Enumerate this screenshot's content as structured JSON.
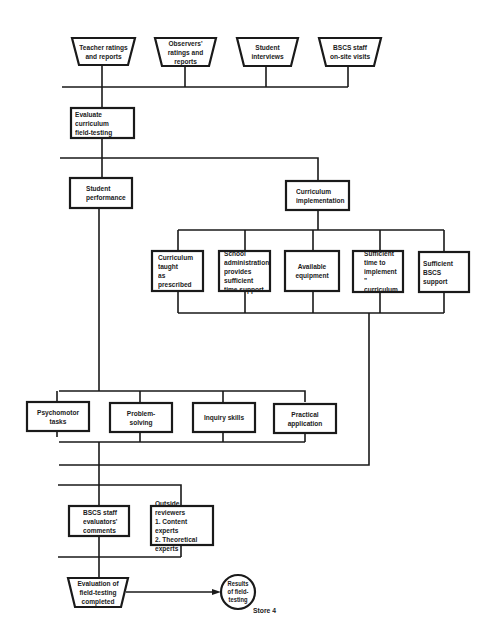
{
  "diagram": {
    "type": "flowchart",
    "inputs": [
      {
        "id": "teacher",
        "label": "Teacher ratings\nand reports",
        "shape": "trapezoid"
      },
      {
        "id": "observers",
        "label": "Observers'\nratings and\nreports",
        "shape": "trapezoid"
      },
      {
        "id": "students",
        "label": "Student\ninterviews",
        "shape": "trapezoid"
      },
      {
        "id": "bscs_visits",
        "label": "BSCS staff\non-site visits",
        "shape": "trapezoid"
      }
    ],
    "evaluate": {
      "label": "Evaluate curriculum\nfield-testing",
      "shape": "process"
    },
    "student_performance": {
      "label": "Student\nperformance",
      "shape": "process"
    },
    "curriculum_implementation": {
      "label": "Curriculum\nimplementation",
      "shape": "process"
    },
    "implementation_factors": [
      {
        "label": "Curriculum\ntaught\nas prescribed"
      },
      {
        "label": "School\nadministration\nprovides\nsufficient\ntime support"
      },
      {
        "label": "Available\nequipment"
      },
      {
        "label": "Sufficient\ntime to\nimplement \"\ncurriculum"
      },
      {
        "label": "Sufficient BSCS\nsupport"
      }
    ],
    "performance_measures": [
      {
        "label": "Psychomotor tasks"
      },
      {
        "label": "Problem-solving"
      },
      {
        "label": "Inquiry skills"
      },
      {
        "label": "Practical application"
      }
    ],
    "reviews": [
      {
        "label": "BSCS staff\nevaluators'\ncomments"
      },
      {
        "label": "Outside reviewers\n1. Content experts\n2. Theoretical\n    experts"
      }
    ],
    "completion": {
      "label": "Evaluation of\nfield-testing\ncompleted",
      "shape": "trapezoid"
    },
    "result": {
      "label": "Results\nof field-\ntesting",
      "shape": "circle"
    },
    "store_note": "Store 4",
    "colors": {
      "line": "#1a1a1a",
      "background": "#ffffff"
    }
  }
}
